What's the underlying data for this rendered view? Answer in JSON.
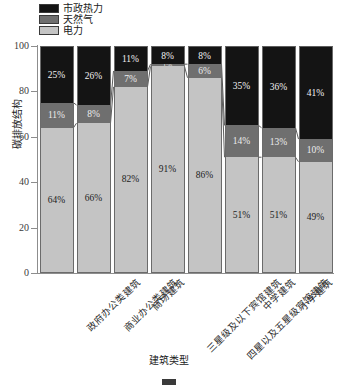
{
  "chart_data": {
    "type": "bar",
    "subtype": "stacked-percentage",
    "title": "",
    "xlabel": "建筑类型",
    "ylabel": "碳排放结构",
    "ylim": [
      0,
      100
    ],
    "yticks": [
      0,
      20,
      40,
      60,
      80,
      100
    ],
    "ytick_labels": [
      "0",
      "20",
      "40",
      "60",
      "80",
      "100"
    ],
    "grid": false,
    "legend_position": "top-left",
    "categories": [
      "政府办公类建筑",
      "商业办公类建筑",
      "商场建筑",
      "三星级及以下宾馆建筑",
      "四星以及五星级宾馆建筑",
      "中学建筑",
      "小学建筑",
      "幼儿园建筑"
    ],
    "series": [
      {
        "name": "市政热力",
        "color": "#141414",
        "values": [
          25,
          26,
          11,
          8,
          8,
          35,
          36,
          41
        ],
        "labels": [
          "25%",
          "26%",
          "11%",
          "8%",
          "8%",
          "35%",
          "36%",
          "41%"
        ]
      },
      {
        "name": "天然气",
        "color": "#6f6f6f",
        "values": [
          11,
          8,
          7,
          1,
          6,
          14,
          13,
          10
        ],
        "labels": [
          "11%",
          "8%",
          "7%",
          "1%",
          "6%",
          "14%",
          "13%",
          "10%"
        ]
      },
      {
        "name": "电力",
        "color": "#c4c4c4",
        "values": [
          64,
          66,
          82,
          91,
          86,
          51,
          51,
          49
        ],
        "labels": [
          "64%",
          "66%",
          "82%",
          "91%",
          "86%",
          "51%",
          "51%",
          "49%"
        ]
      }
    ],
    "stack_order_top_to_bottom": [
      "市政热力",
      "天然气",
      "电力"
    ]
  },
  "legend": {
    "items": [
      {
        "label": "市政热力",
        "color": "#141414"
      },
      {
        "label": "天然气",
        "color": "#6f6f6f"
      },
      {
        "label": "电力",
        "color": "#c4c4c4"
      }
    ]
  },
  "axes": {
    "y_title": "碳排放结构",
    "x_title": "建筑类型"
  }
}
